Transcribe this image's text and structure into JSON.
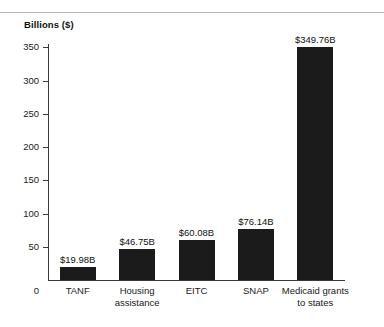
{
  "chart_data": {
    "type": "bar",
    "title": "Billions ($)",
    "xlabel": "",
    "ylabel": "Billions ($)",
    "categories": [
      "TANF",
      "Housing assistance",
      "EITC",
      "SNAP",
      "Medicaid grants to states"
    ],
    "category_lines": [
      [
        "TANF"
      ],
      [
        "Housing",
        "assistance"
      ],
      [
        "EITC"
      ],
      [
        "SNAP"
      ],
      [
        "Medicaid grants",
        "to states"
      ]
    ],
    "values": [
      19.98,
      46.75,
      60.08,
      76.14,
      349.76
    ],
    "value_labels": [
      "$19.98B",
      "$46.75B",
      "$60.08B",
      "$76.14B",
      "$349.76B"
    ],
    "ylim": [
      0,
      355
    ],
    "yticks": [
      0,
      50,
      100,
      150,
      200,
      250,
      300,
      350
    ],
    "ytick_labels": [
      "0",
      "50",
      "100",
      "150",
      "200",
      "250",
      "300",
      "350"
    ],
    "grid": false,
    "legend": null,
    "bar_color": "#1b1b1b",
    "axis_color": "#3a3a3a",
    "rule_color": "#b9b9b9"
  }
}
